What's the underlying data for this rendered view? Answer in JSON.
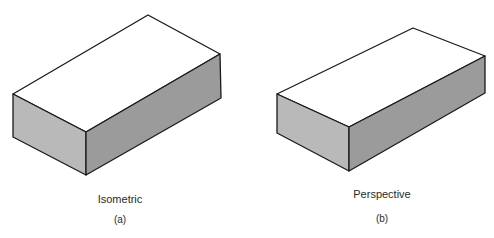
{
  "figure": {
    "panels": [
      {
        "id": "a",
        "caption": "Isometric",
        "sublabel": "(a)",
        "colors": {
          "top": "#ffffff",
          "front": "#b9b9b9",
          "side": "#9b9b9b",
          "edge": "#1a1a1a"
        }
      },
      {
        "id": "b",
        "caption": "Perspective",
        "sublabel": "(b)",
        "colors": {
          "top": "#ffffff",
          "front": "#b9b9b9",
          "side": "#9b9b9b",
          "edge": "#1a1a1a"
        }
      }
    ]
  }
}
